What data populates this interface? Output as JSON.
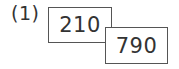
{
  "problem": {
    "label": "(1)",
    "boxes": [
      {
        "value": "210"
      },
      {
        "value": "790"
      }
    ]
  }
}
